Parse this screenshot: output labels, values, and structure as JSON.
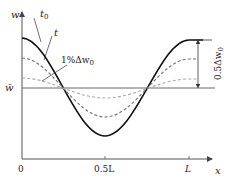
{
  "diagram": {
    "axes": {
      "y_label": "w",
      "x_label": "x",
      "mean_label": "w̄",
      "x_ticks": [
        "0",
        "0.5L",
        "L"
      ]
    },
    "curves": [
      {
        "name": "t0",
        "label": "t",
        "label_sub": "0",
        "style": "solid",
        "amplitude_fraction": 1.0
      },
      {
        "name": "t",
        "label": "t",
        "style": "dashed",
        "amplitude_fraction": 0.6
      },
      {
        "name": "1%",
        "label": "1%Δw",
        "label_sub": "0",
        "style": "dashed-light",
        "amplitude_fraction": 0.2
      }
    ],
    "annotation": {
      "amplitude_label": "0.5Δw",
      "amplitude_sub": "0"
    },
    "colors": {
      "solid": "#111111",
      "dashed": "#777777",
      "dashed_light": "#aaaaaa",
      "axis": "#555555"
    }
  }
}
